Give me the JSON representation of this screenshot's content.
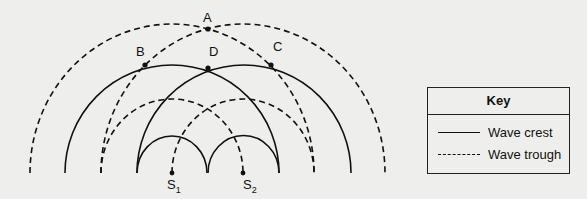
{
  "diagram": {
    "type": "two-source wave interference",
    "points": [
      {
        "label": "A",
        "x": 208,
        "y": 29
      },
      {
        "label": "B",
        "x": 145,
        "y": 65
      },
      {
        "label": "C",
        "x": 271,
        "y": 65
      },
      {
        "label": "D",
        "x": 208,
        "y": 68
      }
    ],
    "sources": [
      {
        "label": "S",
        "sub": "1",
        "x": 172,
        "y": 173
      },
      {
        "label": "S",
        "sub": "2",
        "x": 243,
        "y": 173
      }
    ]
  },
  "key": {
    "title": "Key",
    "items": [
      {
        "style": "solid",
        "label": "Wave crest"
      },
      {
        "style": "dashed",
        "label": "Wave trough"
      }
    ]
  }
}
